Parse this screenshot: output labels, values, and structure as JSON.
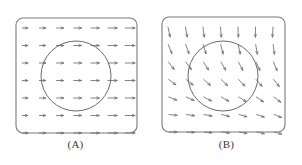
{
  "figure": {
    "width": 302,
    "height": 165,
    "background_color": "#ffffff",
    "line_color": "#6e6e6e",
    "frame_color": "#7a7a7a",
    "circle_color": "#6a6a6a",
    "caption_color": "#3a3a3a",
    "panels": [
      {
        "id": "A",
        "caption": "(A)",
        "frame": {
          "x": 16,
          "y": 18,
          "width": 121,
          "height": 115,
          "corner_radius": 7
        },
        "circle": {
          "cx": 76,
          "cy": 76,
          "r": 35
        },
        "field": {
          "type": "quiver",
          "description": "uniform horizontal vector field pointing right",
          "rows": 7,
          "cols": 7,
          "x_start": 25,
          "y_start": 28,
          "x_step": 17.5,
          "y_step": 17.5,
          "base_length": 7,
          "angles_deg_by_col": [
            0,
            0,
            0,
            0,
            0,
            0,
            0
          ],
          "lengths_by_col": [
            5.5,
            6.2,
            7.0,
            7.6,
            8.2,
            9.0,
            9.6
          ]
        }
      },
      {
        "id": "B",
        "caption": "(B)",
        "frame": {
          "x": 11,
          "y": 17,
          "width": 123,
          "height": 115,
          "corner_radius": 7
        },
        "circle": {
          "cx": 72,
          "cy": 76,
          "r": 35
        },
        "field": {
          "type": "quiver",
          "description": "sheared vector field: steep downward-right arrows at top rotating to horizontal arrows at bottom",
          "rows": 7,
          "cols": 7,
          "x_start": 22,
          "y_start": 27,
          "x_step": 17.5,
          "y_step": 17.5,
          "angles_deg_by_row": [
            78,
            68,
            52,
            36,
            22,
            6,
            0
          ],
          "angle_col_increment_deg": 2.5,
          "lengths_by_row": [
            10.0,
            9.6,
            9.2,
            8.8,
            8.4,
            8.0,
            7.6
          ]
        }
      }
    ]
  },
  "chart_data": {
    "type": "quiver",
    "title": "",
    "xlabel": "",
    "ylabel": "",
    "grid": false,
    "legend": "none",
    "panels": [
      {
        "label": "(A)",
        "field_description": "Uniform flow: all arrows horizontal pointing in +x direction, magnitude increasing slightly with x",
        "inclusion": "circle",
        "grid_points": 49,
        "angle_range_deg": [
          0,
          0
        ],
        "magnitude_range": [
          5.5,
          9.6
        ]
      },
      {
        "label": "(B)",
        "field_description": "Rotational/shear flow: arrow direction rotates from near-vertical (downward) at the top to horizontal at the bottom",
        "inclusion": "circle",
        "grid_points": 49,
        "angle_range_deg": [
          0,
          78
        ],
        "magnitude_range": [
          7.6,
          10.0
        ]
      }
    ]
  }
}
